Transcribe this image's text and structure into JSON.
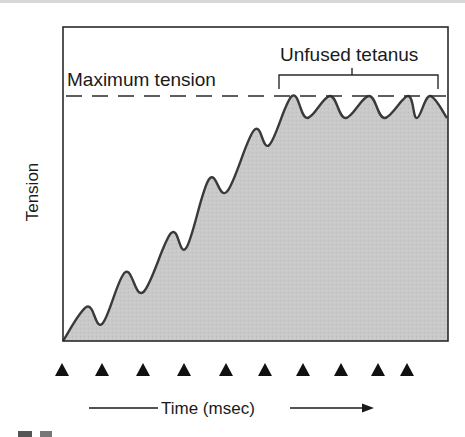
{
  "chart_data": {
    "type": "area",
    "title": "",
    "xlabel": "Time (msec)",
    "ylabel": "Tension",
    "annotations": {
      "max_line_label": "Maximum tension",
      "bracket_label": "Unfused tetanus"
    },
    "ylim": [
      0,
      1
    ],
    "max_tension": 1.0,
    "stimuli_count": 10,
    "stimulus_marker": "triangle",
    "twitch_curve": {
      "description": "Summation of twitches leading to unfused tetanus",
      "peaks": [
        {
          "t": 1,
          "tension": 0.14
        },
        {
          "t": 2,
          "tension": 0.28
        },
        {
          "t": 3,
          "tension": 0.44
        },
        {
          "t": 4,
          "tension": 0.66
        },
        {
          "t": 5,
          "tension": 0.86
        },
        {
          "t": 6,
          "tension": 1.0
        },
        {
          "t": 7,
          "tension": 1.0
        },
        {
          "t": 8,
          "tension": 1.0
        },
        {
          "t": 9,
          "tension": 1.0
        },
        {
          "t": 10,
          "tension": 1.0
        }
      ],
      "troughs": [
        {
          "t": 1.4,
          "tension": 0.07
        },
        {
          "t": 2.4,
          "tension": 0.2
        },
        {
          "t": 3.4,
          "tension": 0.38
        },
        {
          "t": 4.4,
          "tension": 0.61
        },
        {
          "t": 5.4,
          "tension": 0.8
        },
        {
          "t": 6.4,
          "tension": 0.91
        },
        {
          "t": 7.4,
          "tension": 0.91
        },
        {
          "t": 8.4,
          "tension": 0.91
        },
        {
          "t": 9.4,
          "tension": 0.91
        }
      ]
    },
    "grid": false,
    "legend": "none"
  }
}
